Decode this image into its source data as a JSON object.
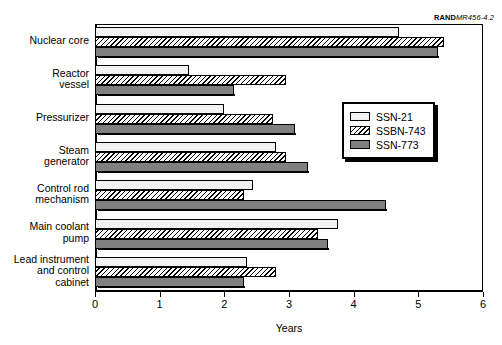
{
  "source_credit": {
    "bold": "RAND",
    "italic": "MR456-4.2"
  },
  "legend": {
    "position": "inside-right",
    "items": [
      {
        "label": "SSN-21",
        "swatch": "white-swatch"
      },
      {
        "label": "SSBN-743",
        "swatch": "hatched-swatch"
      },
      {
        "label": "SSN-773",
        "swatch": "gray-swatch"
      }
    ]
  },
  "axis": {
    "x_title": "Years",
    "x_ticks": [
      "0",
      "1",
      "2",
      "3",
      "4",
      "5",
      "6"
    ]
  },
  "chart_data": {
    "type": "bar",
    "orientation": "horizontal",
    "title": "",
    "xlabel": "Years",
    "ylabel": "",
    "xlim": [
      0,
      6
    ],
    "grid": false,
    "legend_position": "inside-right",
    "annotations": [
      "RANDMR456-4.2"
    ],
    "categories": [
      "Nuclear core",
      "Reactor\nvessel",
      "Pressurizer",
      "Steam\ngenerator",
      "Control rod\nmechanism",
      "Main coolant\npump",
      "Lead instrument\nand control\ncabinet"
    ],
    "series": [
      {
        "name": "SSN-21",
        "color": "#f2f2f2",
        "values": [
          4.7,
          1.45,
          2.0,
          2.8,
          2.45,
          3.75,
          2.35
        ]
      },
      {
        "name": "SSBN-743",
        "color": "#ffffff",
        "pattern": "diagonal-hatch",
        "values": [
          5.4,
          2.95,
          2.75,
          2.95,
          2.3,
          3.45,
          2.8
        ]
      },
      {
        "name": "SSN-773",
        "color": "#808080",
        "values": [
          5.3,
          2.15,
          3.1,
          3.3,
          4.5,
          3.6,
          2.3
        ]
      }
    ]
  }
}
